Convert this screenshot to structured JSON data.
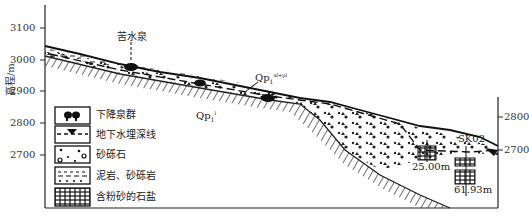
{
  "figure": {
    "type": "geological cross-section",
    "y_axis_label": "高程/m",
    "left_axis_ticks": [
      "3100",
      "3000",
      "2900",
      "2800",
      "2700"
    ],
    "right_axis_ticks": [
      "2800",
      "2700"
    ]
  },
  "annotations": {
    "spring_name": "苦水泉",
    "unit_upper": {
      "base": "Qp",
      "sub": "1",
      "sup": "al+pl"
    },
    "unit_lower": {
      "base": "Qp",
      "sub": "1",
      "sup": "l"
    },
    "borehole": "SK02",
    "depth_1": "25.00m",
    "depth_2": "61.93m"
  },
  "legend": {
    "items": [
      {
        "symbol": "spring-group",
        "label": "下降泉群"
      },
      {
        "symbol": "water-table-line",
        "label": "地下水埋深线"
      },
      {
        "symbol": "gravel",
        "label": "砂砾石"
      },
      {
        "symbol": "mudstone-conglomerate",
        "label": "泥岩、砂砾岩"
      },
      {
        "symbol": "silty-rock-salt",
        "label": "含粉砂的石盐"
      }
    ]
  }
}
